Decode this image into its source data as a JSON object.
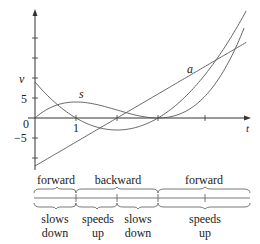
{
  "chart_data": {
    "type": "line",
    "title": "",
    "xlabel": "t",
    "ylabel": "",
    "xlim": [
      0,
      5.2
    ],
    "ylim": [
      -12,
      26
    ],
    "grid": false,
    "legend": "inline labels",
    "y_tick_labels": [
      "5",
      "0",
      "-5"
    ],
    "x_tick_labels": [
      "1"
    ],
    "series": [
      {
        "name": "v",
        "label": "v",
        "formula": "3t^2 - 12t + 9",
        "x": [
          0,
          0.5,
          1,
          1.5,
          2,
          2.5,
          3,
          3.5,
          4,
          4.5,
          5
        ],
        "values": [
          9,
          3.75,
          0,
          -2.25,
          -3,
          -2.25,
          0,
          3.75,
          9,
          15.75,
          24
        ]
      },
      {
        "name": "s",
        "label": "s",
        "formula": "t^3 - 6t^2 + 9t",
        "x": [
          0,
          0.5,
          1,
          1.5,
          2,
          2.5,
          3,
          3.5,
          4,
          4.5,
          5
        ],
        "values": [
          0,
          3.125,
          4,
          3.375,
          2,
          0.625,
          0,
          0.875,
          4,
          10.125,
          20
        ]
      },
      {
        "name": "a",
        "label": "a",
        "formula": "6t - 12",
        "x": [
          0,
          1,
          2,
          3,
          4,
          5
        ],
        "values": [
          -12,
          -6,
          0,
          6,
          12,
          18
        ]
      }
    ],
    "annotations": {
      "direction": [
        {
          "label": "forward",
          "from": 0,
          "to": 1
        },
        {
          "label": "backward",
          "from": 1,
          "to": 3
        },
        {
          "label": "forward",
          "from": 3,
          "to": 5.2
        }
      ],
      "speed": [
        {
          "line1": "slows",
          "line2": "down",
          "from": 0,
          "to": 1
        },
        {
          "line1": "speeds",
          "line2": "up",
          "from": 1,
          "to": 2
        },
        {
          "line1": "slows",
          "line2": "down",
          "from": 2,
          "to": 3
        },
        {
          "line1": "speeds",
          "line2": "up",
          "from": 3,
          "to": 5.2
        }
      ]
    }
  },
  "labels": {
    "v": "v",
    "s": "s",
    "a": "a",
    "t": "t",
    "y5": "5",
    "y0": "0",
    "yneg5": "−5",
    "x1": "1"
  },
  "direction_labels": [
    "forward",
    "backward",
    "forward"
  ],
  "speed_labels": [
    {
      "line1": "slows",
      "line2": "down"
    },
    {
      "line1": "speeds",
      "line2": "up"
    },
    {
      "line1": "slows",
      "line2": "down"
    },
    {
      "line1": "speeds",
      "line2": "up"
    }
  ]
}
